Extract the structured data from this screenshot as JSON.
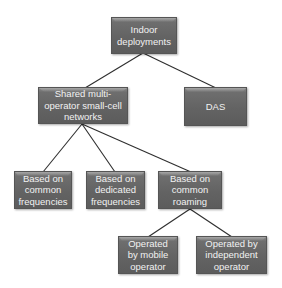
{
  "diagram": {
    "type": "tree",
    "colors": {
      "node_fill": "#636363",
      "node_text": "#f2f2f2",
      "connector": "#333333",
      "background": "#ffffff"
    },
    "nodes": [
      {
        "id": "indoor",
        "label": "Indoor\ndeployments"
      },
      {
        "id": "shared",
        "label": "Shared multi-\noperator small-cell\nnetworks"
      },
      {
        "id": "das",
        "label": "DAS"
      },
      {
        "id": "common_freq",
        "label": "Based on\ncommon\nfrequencies"
      },
      {
        "id": "dedicated_freq",
        "label": "Based on\ndedicated\nfrequencies"
      },
      {
        "id": "common_roaming",
        "label": "Based on\ncommon\nroaming"
      },
      {
        "id": "mobile_op",
        "label": "Operated\nby mobile\noperator"
      },
      {
        "id": "independent_op",
        "label": "Operated by\nindependent\noperator"
      }
    ],
    "edges": [
      {
        "from": "indoor",
        "to": "shared"
      },
      {
        "from": "indoor",
        "to": "das"
      },
      {
        "from": "shared",
        "to": "common_freq"
      },
      {
        "from": "shared",
        "to": "dedicated_freq"
      },
      {
        "from": "shared",
        "to": "common_roaming"
      },
      {
        "from": "common_roaming",
        "to": "mobile_op"
      },
      {
        "from": "common_roaming",
        "to": "independent_op"
      }
    ]
  }
}
